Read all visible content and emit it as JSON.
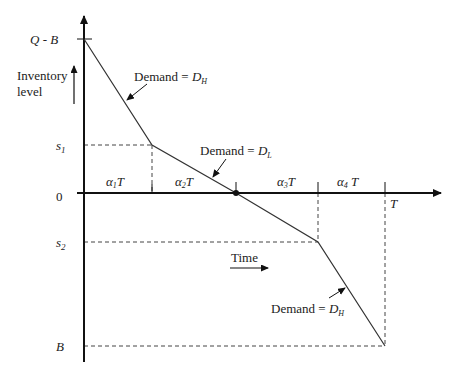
{
  "diagram": {
    "type": "inventory-level-time-diagram",
    "y_axis_label_line1": "Inventory",
    "y_axis_label_line2": "level",
    "x_axis_label": "Time",
    "y_ticks": {
      "top": "Q - B",
      "s1_base": "s",
      "s1_sub": "1",
      "zero": "0",
      "s2_base": "s",
      "s2_sub": "2",
      "bottom": "B"
    },
    "x_end_label": "T",
    "segments": [
      {
        "alpha": "α",
        "sub": "1",
        "suffix": "T"
      },
      {
        "alpha": "α",
        "sub": "2",
        "suffix": "T"
      },
      {
        "alpha": "α",
        "sub": "3",
        "suffix": "T"
      },
      {
        "alpha": "α",
        "sub": "4",
        "suffix": " T"
      }
    ],
    "demand_labels": [
      {
        "prefix": "Demand = ",
        "var": "D",
        "sub": "H"
      },
      {
        "prefix": "Demand = ",
        "var": "D",
        "sub": "L"
      },
      {
        "prefix": "Demand = ",
        "var": "D",
        "sub": "H"
      }
    ],
    "path_points": [
      [
        84,
        39
      ],
      [
        152,
        145
      ],
      [
        236,
        193
      ],
      [
        318,
        242
      ],
      [
        385,
        346
      ]
    ],
    "line_color": "#333333"
  }
}
